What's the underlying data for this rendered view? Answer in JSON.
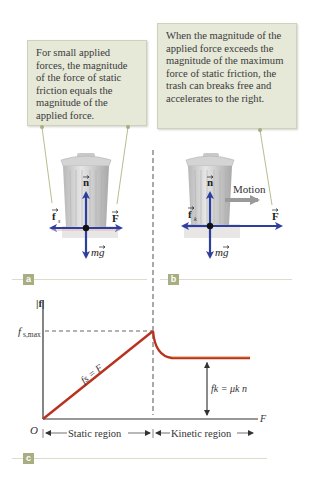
{
  "panel_a": {
    "label": "a",
    "callout_text": "For small applied forces, the magnitude of the force of static friction equals the magnitude of the applied force.",
    "vectors": {
      "normal": "n",
      "friction": "f",
      "friction_sub": "s",
      "applied": "F",
      "weight": "mg"
    }
  },
  "panel_b": {
    "label": "b",
    "callout_text": "When the magnitude of the applied force exceeds the magnitude of the maximum force of static friction, the trash can breaks free and accelerates to the right.",
    "motion_label": "Motion",
    "vectors": {
      "normal": "n",
      "friction": "f",
      "friction_sub": "k",
      "applied": "F",
      "weight": "mg"
    }
  },
  "panel_c": {
    "label": "c",
    "y_axis_label": "|f|",
    "x_axis_label": "F",
    "origin_label": "O",
    "fs_max_label": "f",
    "fs_max_sub": "s,max",
    "static_eq": "fs = F",
    "kinetic_eq": "fk = μk n",
    "static_region": "Static region",
    "kinetic_region": "Kinetic region"
  },
  "colors": {
    "callout_bg": "#e6e8d8",
    "vector_blue": "#2c3e9e",
    "curve_red": "#b8321e",
    "panel_label_bg": "#a9ad82",
    "ground_pink": "#e4b6b8"
  }
}
